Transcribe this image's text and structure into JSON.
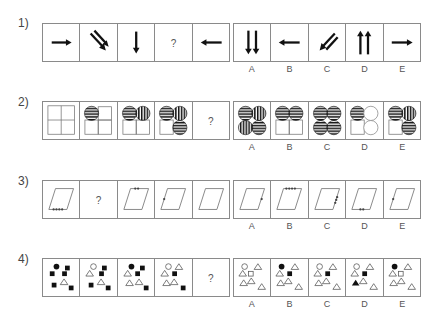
{
  "questions": [
    {
      "number": "1)",
      "sequence": [
        "arrow-right",
        "double-arrow-down-right",
        "arrow-down",
        "?",
        "arrow-left"
      ],
      "options": [
        {
          "label": "A",
          "figure": "double-arrow-down"
        },
        {
          "label": "B",
          "figure": "arrow-left"
        },
        {
          "label": "C",
          "figure": "double-arrow-down-left"
        },
        {
          "label": "D",
          "figure": "double-arrow-up"
        },
        {
          "label": "E",
          "figure": "arrow-right"
        }
      ]
    },
    {
      "number": "2)",
      "sequence": [
        "four-empty-squares",
        "TL horizontal-striped circle, others squares",
        "TL horizontal circle, TR vertical circle, bottom squares",
        "TL horizontal circle, TR vertical circle, BL square, BR horizontal circle",
        "?"
      ],
      "options": [
        {
          "label": "A",
          "figure": "TL horizontal, TR vertical, BL vertical, BR horizontal"
        },
        {
          "label": "B",
          "figure": "TL horizontal, TR horizontal, bottom squares"
        },
        {
          "label": "C",
          "figure": "all four horizontal circles"
        },
        {
          "label": "D",
          "figure": "TL horizontal, TR empty circle, BL square, BR empty circle"
        },
        {
          "label": "E",
          "figure": "TL horizontal, TR vertical, BL square, BR horizontal"
        }
      ]
    },
    {
      "number": "3)",
      "sequence": [
        "parallelogram, 4 dots on bottom edge",
        "?",
        "parallelogram, 2 dots on top edge",
        "parallelogram, 1 dot on left edge",
        "parallelogram, no dots"
      ],
      "options": [
        {
          "label": "A",
          "figure": "1 dot on right edge"
        },
        {
          "label": "B",
          "figure": "4 dots on top edge"
        },
        {
          "label": "C",
          "figure": "3 dots on right edge"
        },
        {
          "label": "D",
          "figure": "2 dots on bottom edge"
        },
        {
          "label": "E",
          "figure": "1 dot on left edge"
        }
      ]
    },
    {
      "number": "4)",
      "sequence": [
        "black circle, 5 squares, 1 triangle",
        "white circle, 4 squares, 2 triangles",
        "black circle, 3 squares, 3 triangles",
        "white circle, 2 squares, 4 triangles",
        "?"
      ],
      "options": [
        {
          "label": "A",
          "figure": "white circle, white square, 5 triangles"
        },
        {
          "label": "B",
          "figure": "black circle, black square, 5 triangles"
        },
        {
          "label": "C",
          "figure": "white circle, black square, 5 triangles"
        },
        {
          "label": "D",
          "figure": "white circle, black square, black triangle, 4 triangles"
        },
        {
          "label": "E",
          "figure": "black circle, white square, 5 triangles"
        }
      ]
    }
  ],
  "question_mark": "?"
}
